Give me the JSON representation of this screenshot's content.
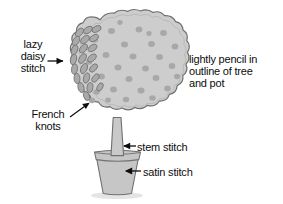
{
  "figure": {
    "background_color": "#ffffff"
  },
  "palette": {
    "fill_light": "#cdcdcd",
    "fill_mid": "#c2c2c2",
    "fill_pot": "#c6c6c6",
    "knot_dot": "#a8a8a8",
    "petal_fill": "#a9a9a9",
    "outline": "#6f6f6f",
    "ink": "#0d0d0d",
    "shadow": "#e4e4e4"
  },
  "labels": {
    "lazy_daisy": "lazy\ndaisy\nstitch",
    "pencil_outline": "lightly pencil in\noutline of tree\nand pot",
    "french_knots": "French\nknots",
    "stem_stitch": "stem stitch",
    "satin_stitch": "satin stitch"
  },
  "parts": {
    "canopy": "tree-canopy",
    "trunk": "tree-trunk",
    "pot": "flower-pot",
    "pot_rim": "flower-pot-rim",
    "shadow": "ground-shadow"
  },
  "annotations": [
    {
      "name": "lazy-daisy",
      "target": "canopy-left-petals",
      "arrow": "horizontal-right"
    },
    {
      "name": "french-knots",
      "target": "canopy-dot",
      "arrow": "diagonal-up-right"
    },
    {
      "name": "stem-stitch",
      "target": "trunk",
      "arrow": "horizontal-left"
    },
    {
      "name": "satin-stitch",
      "target": "pot-body",
      "arrow": "horizontal-left"
    },
    {
      "name": "pencil-outline",
      "target": "tree-and-pot-outline",
      "arrow": "none"
    }
  ],
  "counts": {
    "french_knots_visible": 28,
    "lazy_daisy_petals_visible": 22
  }
}
